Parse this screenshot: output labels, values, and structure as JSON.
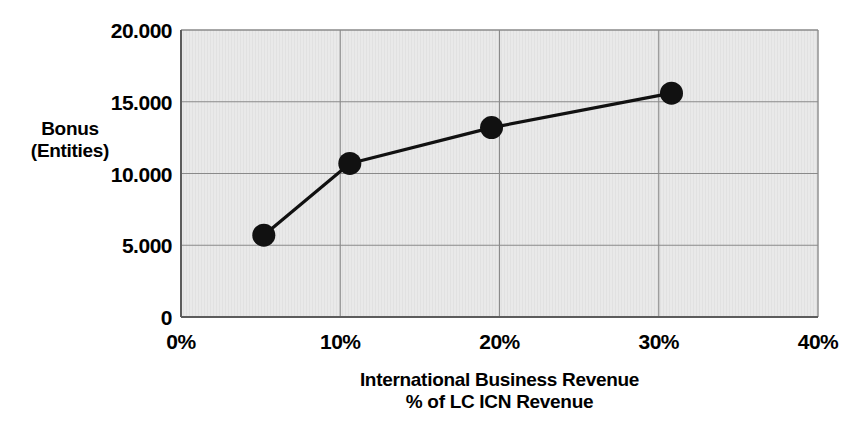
{
  "chart_data": {
    "type": "line",
    "title": "",
    "subtitle": "",
    "xlabel": "International Business Revenue % of LC ICN Revenue",
    "xlabel_line1": "International Business Revenue",
    "xlabel_line2": "% of LC ICN Revenue",
    "ylabel": "Bonus (Entities)",
    "ylabel_line1": "Bonus",
    "ylabel_line2": "(Entities)",
    "xlim": [
      0,
      40
    ],
    "ylim": [
      0,
      20000
    ],
    "grid": true,
    "legend": "none",
    "x_tick_labels": [
      "0%",
      "10%",
      "20%",
      "30%",
      "40%"
    ],
    "x_tick_values": [
      0,
      10,
      20,
      30,
      40
    ],
    "y_tick_labels": [
      "0",
      "5.000",
      "10.000",
      "15.000",
      "20.000"
    ],
    "y_tick_values": [
      0,
      5000,
      10000,
      15000,
      20000
    ],
    "series": [
      {
        "name": "Bonus vs International Business Revenue",
        "x": [
          5.2,
          10.6,
          19.5,
          30.8
        ],
        "y": [
          5700,
          10700,
          13200,
          15600
        ],
        "marker": "circle",
        "marker_color": "#111111",
        "line_color": "#111111"
      }
    ],
    "colors": {
      "plot_background": "#e8e8e8",
      "grid_line": "#8a8a8a",
      "axis_line": "#6e6e6e",
      "series_line": "#111111",
      "marker_fill": "#111111",
      "text": "#000000",
      "page_background": "#ffffff"
    }
  }
}
